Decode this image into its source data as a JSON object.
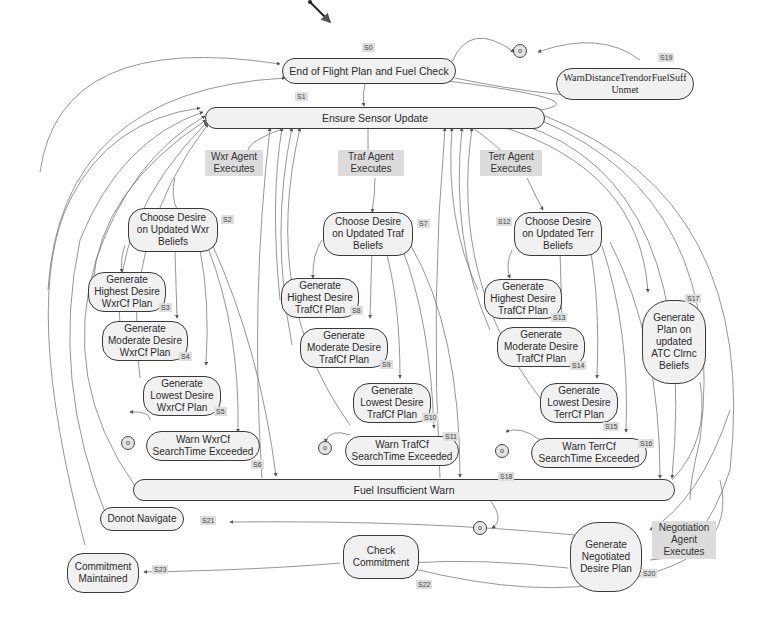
{
  "diagram": {
    "nodes": {
      "s0": {
        "label": "End of Flight Plan and Fuel Check",
        "state": "S0"
      },
      "s1": {
        "label": "Ensure Sensor Update",
        "state": "S1"
      },
      "s2": {
        "label": "Choose Desire on Updated Wxr Beliefs",
        "state": "S2"
      },
      "s3": {
        "label": "Generate Highest Desire WxrCf Plan",
        "state": "S3"
      },
      "s4": {
        "label": "Generate Moderate Desire WxrCf Plan",
        "state": "S4"
      },
      "s5": {
        "label": "Generate Lowest Desire WxrCf Plan",
        "state": "S5"
      },
      "s6": {
        "label": "Warn WxrCf SearchTime Exceeded",
        "state": "S6"
      },
      "s7": {
        "label": "Choose Desire on Updated Traf Beliefs",
        "state": "S7"
      },
      "s8": {
        "label": "Generate Highest Desire TrafCf Plan",
        "state": "S8"
      },
      "s9": {
        "label": "Generate Moderate Desire TrafCf Plan",
        "state": "S9"
      },
      "s10": {
        "label": "Generate Lowest Desire TrafCf Plan",
        "state": "S10"
      },
      "s11": {
        "label": "Warn TrafCf SearchTime Exceeded",
        "state": "S11"
      },
      "s12": {
        "label": "Choose Desire on Updated Terr Beliefs",
        "state": "S12"
      },
      "s13": {
        "label": "Generate Highest Desire TrafCf Plan",
        "state": "S13"
      },
      "s14": {
        "label": "Generate Moderate Desire TrafCf Plan",
        "state": "S14"
      },
      "s15": {
        "label": "Generate Lowest Desire TerrCf Plan",
        "state": "S15"
      },
      "s16": {
        "label": "Warn TerrCf SearchTime Exceeded",
        "state": "S16"
      },
      "s17": {
        "label": "Generate Plan on updated ATC Clrnc Beliefs",
        "state": "S17"
      },
      "s18": {
        "label": "Fuel Insufficient Warn",
        "state": "S18"
      },
      "s19": {
        "label": "WarnDistanceTrendorFuelSuff Unmet",
        "state": "S19"
      },
      "s20": {
        "label": "Generate Negotiated Desire Plan",
        "state": "S20"
      },
      "s21": {
        "label": "Donot Navigate",
        "state": "S21"
      },
      "s22": {
        "label": "Check Commitment",
        "state": "S22"
      },
      "s23": {
        "label": "Commitment Maintained",
        "state": "S23"
      }
    },
    "agents": {
      "wxr": "Wxr Agent Executes",
      "traf": "Traf Agent Executes",
      "terr": "Terr Agent Executes",
      "negotiation": "Negotiation Agent Executes"
    },
    "terminal_symbol": "o",
    "colors": {
      "node_fill": "#f1f1f1",
      "node_border": "#3a3a3a",
      "label_bg": "#dcdcdc",
      "edge": "#7a7a7a"
    }
  }
}
